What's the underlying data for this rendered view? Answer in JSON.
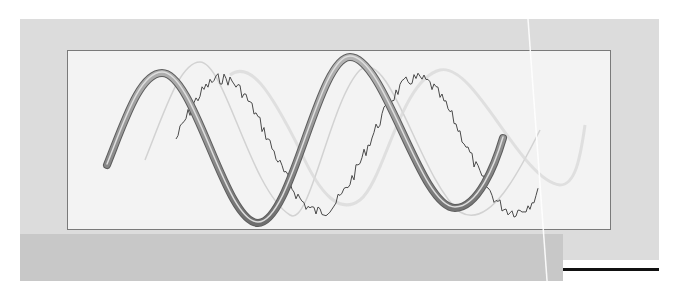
{
  "figure": {
    "colors": {
      "page_background": "#ffffff",
      "outer_panel": "#dcdcdc",
      "bottom_band": "#c8c8c8",
      "frame_fill": "#f3f3f3",
      "frame_border": "#7a7a7a",
      "tube_wave": "#8a8a8a",
      "noisy_wave": "#555555",
      "ghost_wave": "#cfcfcf",
      "rule_line": "#111111"
    },
    "waves": [
      {
        "name": "tube-sine-wave",
        "style": "solid tube",
        "start": [
          107,
          165
        ],
        "end": [
          503,
          138
        ],
        "peaks_y": [
          73,
          57
        ],
        "troughs_y": [
          223,
          208
        ]
      },
      {
        "name": "noisy-sine-wave",
        "style": "jagged noisy",
        "start": [
          176,
          140
        ],
        "end": [
          538,
          128
        ]
      },
      {
        "name": "ghost-sine-wave",
        "style": "faint",
        "start": [
          145,
          160
        ],
        "end": [
          570,
          120
        ]
      }
    ]
  }
}
